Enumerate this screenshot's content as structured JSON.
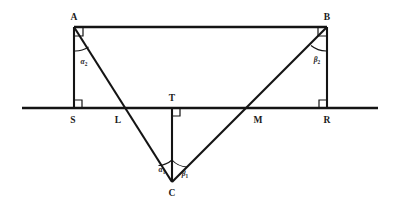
{
  "figure": {
    "background_color": "#ffffff",
    "line_color": "#141414",
    "points": {
      "A": {
        "label": "A",
        "x": 74,
        "y": 27
      },
      "B": {
        "label": "B",
        "x": 327,
        "y": 27
      },
      "C": {
        "label": "C",
        "x": 172,
        "y": 182
      },
      "S": {
        "label": "S",
        "x": 74,
        "y": 108
      },
      "L": {
        "label": "L",
        "x": 118,
        "y": 108
      },
      "T": {
        "label": "T",
        "x": 172,
        "y": 108
      },
      "M": {
        "label": "M",
        "x": 250,
        "y": 108
      },
      "R": {
        "label": "R",
        "x": 327,
        "y": 108
      }
    },
    "angles": [
      {
        "name": "alpha-2",
        "symbol": "α",
        "subscript": "2",
        "at_point": "A",
        "x": 84,
        "y": 61
      },
      {
        "name": "beta-2",
        "symbol": "β",
        "subscript": "2",
        "at_point": "B",
        "x": 317,
        "y": 59
      },
      {
        "name": "alpha-1",
        "symbol": "α",
        "subscript": "1",
        "at_point": "C",
        "x": 162,
        "y": 169
      },
      {
        "name": "beta-1",
        "symbol": "β",
        "subscript": "1",
        "at_point": "C",
        "x": 184,
        "y": 173
      }
    ],
    "segments": [
      {
        "name": "segment-AB",
        "from": "A",
        "to": "B"
      },
      {
        "name": "segment-AS",
        "from": "A",
        "to": "S"
      },
      {
        "name": "segment-BR",
        "from": "B",
        "to": "R"
      },
      {
        "name": "segment-TC",
        "from": "T",
        "to": "C"
      },
      {
        "name": "segment-AC",
        "from": "A",
        "to": "C"
      },
      {
        "name": "segment-BC",
        "from": "B",
        "to": "C"
      }
    ],
    "baseline": {
      "name": "horizontal-baseline",
      "x1": 22,
      "x2": 378,
      "y": 108
    },
    "right_angles": [
      {
        "name": "right-angle-at-S",
        "at_point": "S"
      },
      {
        "name": "right-angle-at-T",
        "at_point": "T"
      },
      {
        "name": "right-angle-at-R",
        "at_point": "R"
      },
      {
        "name": "right-angle-at-A",
        "at_point": "A"
      },
      {
        "name": "right-angle-at-B",
        "at_point": "B"
      }
    ]
  }
}
